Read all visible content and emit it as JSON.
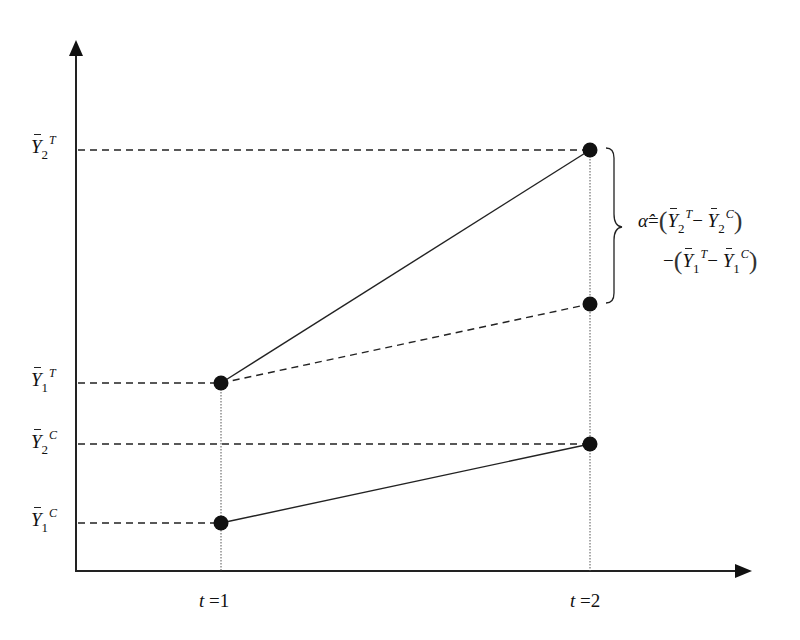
{
  "diagram": {
    "type": "difference-in-differences",
    "axes": {
      "x_ticks": [
        {
          "var": "t",
          "eq": "=",
          "value": "1"
        },
        {
          "var": "t",
          "eq": "=",
          "value": "2"
        }
      ]
    },
    "y_labels": [
      {
        "id": "Y2T",
        "symbol": "Y",
        "sub": "2",
        "sup": "T"
      },
      {
        "id": "Y1T",
        "symbol": "Y",
        "sub": "1",
        "sup": "T"
      },
      {
        "id": "Y2C",
        "symbol": "Y",
        "sub": "2",
        "sup": "C"
      },
      {
        "id": "Y1C",
        "symbol": "Y",
        "sub": "1",
        "sup": "C"
      }
    ],
    "points": [
      {
        "id": "Y1T",
        "t": 1,
        "x": 221,
        "y": 383
      },
      {
        "id": "Y2T",
        "t": 2,
        "x": 590,
        "y": 150
      },
      {
        "id": "Y1C",
        "t": 1,
        "x": 221,
        "y": 523
      },
      {
        "id": "Y2C",
        "t": 2,
        "x": 590,
        "y": 444
      },
      {
        "id": "counterfactual",
        "t": 2,
        "x": 590,
        "y": 304
      }
    ],
    "formula": {
      "lhs": "α̂",
      "eq": "=",
      "line1": {
        "open": "(",
        "a": {
          "symbol": "Y",
          "sub": "2",
          "sup": "T"
        },
        "minus": "−",
        "b": {
          "symbol": "Y",
          "sub": "2",
          "sup": "C"
        },
        "close": ")"
      },
      "line2": {
        "lead": "−",
        "open": "(",
        "a": {
          "symbol": "Y",
          "sub": "1",
          "sup": "T"
        },
        "minus": "−",
        "b": {
          "symbol": "Y",
          "sub": "1",
          "sup": "C"
        },
        "close": ")"
      }
    },
    "colors": {
      "ink": "#111111",
      "background": "#ffffff"
    }
  }
}
